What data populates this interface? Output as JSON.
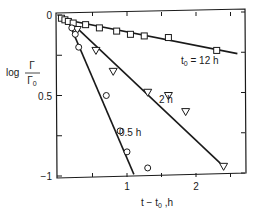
{
  "chart_data": {
    "type": "scatter",
    "title": "",
    "xlabel": "t − t0, h",
    "ylabel": "log Γ/Γ0",
    "xlim": [
      0,
      2.7
    ],
    "ylim": [
      -1.0,
      0
    ],
    "x_ticks": [
      {
        "value": 1,
        "label": "1"
      },
      {
        "value": 2,
        "label": "2"
      }
    ],
    "y_ticks": [
      {
        "value": 0,
        "label": "0"
      },
      {
        "value": -0.5,
        "label": "0.5"
      },
      {
        "value": -1,
        "label": "−1"
      }
    ],
    "grid": false,
    "legend": "inline annotations",
    "series": [
      {
        "name": "t0 = 12 h",
        "marker": "square",
        "x": [
          0.05,
          0.1,
          0.15,
          0.22,
          0.4,
          0.6,
          0.85,
          1.05,
          1.25,
          1.6,
          2.3
        ],
        "y": [
          -0.02,
          -0.03,
          -0.04,
          -0.05,
          -0.06,
          -0.08,
          -0.1,
          -0.12,
          -0.13,
          -0.14,
          -0.22
        ],
        "fit_line": {
          "x": [
            0,
            2.6
          ],
          "y": [
            -0.02,
            -0.24
          ]
        }
      },
      {
        "name": "2 h",
        "marker": "triangle-down",
        "x": [
          0.28,
          0.55,
          0.8,
          1.3,
          1.6,
          1.85,
          2.4
        ],
        "y": [
          -0.09,
          -0.22,
          -0.35,
          -0.48,
          -0.5,
          -0.6,
          -0.94
        ],
        "fit_line": {
          "x": [
            0.2,
            2.35
          ],
          "y": [
            -0.05,
            -0.92
          ]
        }
      },
      {
        "name": "0.5 h",
        "marker": "circle",
        "x": [
          0.2,
          0.25,
          0.3,
          0.7,
          0.9,
          1.0,
          1.3
        ],
        "y": [
          -0.08,
          -0.12,
          -0.2,
          -0.5,
          -0.72,
          -0.85,
          -0.95
        ],
        "fit_line": {
          "x": [
            0.15,
            1.1
          ],
          "y": [
            -0.04,
            -0.99
          ]
        }
      }
    ],
    "annotations": [
      {
        "text": "t0 = 12 h",
        "series": "12 h"
      },
      {
        "text": "2 h",
        "series": "2 h"
      },
      {
        "text": "0.5 h",
        "series": "0.5 h"
      }
    ]
  },
  "labels": {
    "ylabel_log": "log",
    "ylabel_num": "Γ",
    "ylabel_den": "Γ0",
    "xlabel": "t − t0 ,h",
    "ann_12h": "t0 = 12 h",
    "ann_2h": "2 h",
    "ann_05h": "0.5 h"
  }
}
